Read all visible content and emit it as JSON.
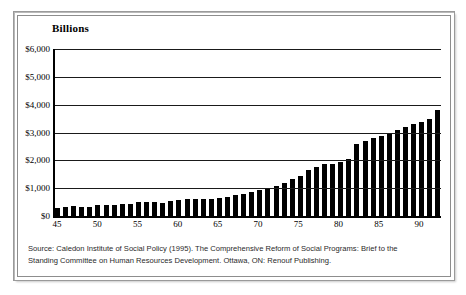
{
  "chart": {
    "title": "Billions",
    "y_axis_labels": [
      "$6,000",
      "$5,000",
      "$4,000",
      "$3,000",
      "$2,000",
      "$1,000",
      "$0"
    ],
    "x_axis_labels": [
      "45",
      "50",
      "55",
      "60",
      "65",
      "70",
      "75",
      "80",
      "85",
      "90"
    ]
  },
  "source": {
    "line1": "Source: Caledon Institute of Social Policy (1995). The Comprehensive Reform of Social Programs: Brief to the",
    "line2": "Standing Committee on Human Resources Development. Ottawa, ON: Renouf Publishing."
  },
  "chart_data": {
    "type": "bar",
    "title": "Billions",
    "xlabel": "",
    "ylabel": "Billions",
    "ylim": [
      0,
      6000
    ],
    "ytick_values": [
      0,
      1000,
      2000,
      3000,
      4000,
      5000,
      6000
    ],
    "ytick_labels": [
      "$0",
      "$1,000",
      "$2,000",
      "$3,000",
      "$4,000",
      "$5,000",
      "$6,000"
    ],
    "xtick_labels": [
      "45",
      "50",
      "55",
      "60",
      "65",
      "70",
      "75",
      "80",
      "85",
      "90"
    ],
    "grid": true,
    "legend": null,
    "bar_color": "#000000",
    "categories": [
      "45",
      "46",
      "47",
      "48",
      "49",
      "50",
      "51",
      "52",
      "53",
      "54",
      "55",
      "56",
      "57",
      "58",
      "59",
      "60",
      "61",
      "62",
      "63",
      "64",
      "65",
      "66",
      "67",
      "68",
      "69",
      "70",
      "71",
      "72",
      "73",
      "74",
      "75",
      "76",
      "77",
      "78",
      "79",
      "80",
      "81",
      "82",
      "83",
      "84",
      "85",
      "86",
      "87",
      "88",
      "89",
      "90",
      "91",
      "92"
    ],
    "values": [
      300,
      310,
      365,
      335,
      330,
      400,
      400,
      395,
      420,
      430,
      495,
      510,
      515,
      470,
      530,
      560,
      600,
      620,
      620,
      625,
      660,
      700,
      740,
      790,
      870,
      930,
      1000,
      1080,
      1190,
      1320,
      1430,
      1650,
      1760,
      1870,
      1880,
      1950,
      2040,
      2600,
      2700,
      2790,
      2870,
      2980,
      3080,
      3200,
      3290,
      3380,
      3470,
      3820
    ]
  }
}
